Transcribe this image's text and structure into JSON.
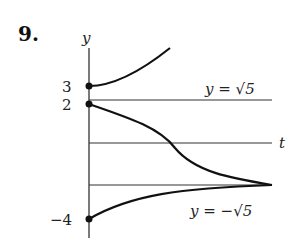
{
  "problem_number": "9.",
  "axes": {
    "y_label": "y",
    "t_label": "t"
  },
  "ticks": {
    "y3": "3",
    "y2": "2",
    "yneg4": "−4"
  },
  "equilibria": {
    "upper": "y = √5",
    "lower": "y = −√5"
  },
  "colors": {
    "ink": "#111111",
    "line": "#333333"
  }
}
